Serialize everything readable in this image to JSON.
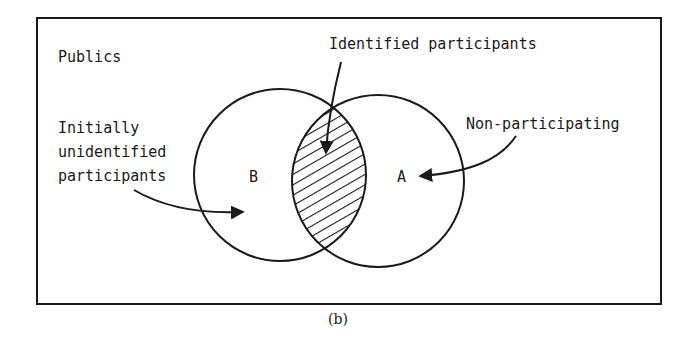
{
  "diagram": {
    "type": "venn",
    "frame_title": "Publics",
    "caption": "(b)",
    "sets": [
      {
        "id": "B",
        "label": "B"
      },
      {
        "id": "A",
        "label": "A"
      }
    ],
    "annotations": {
      "intersection": "Identified participants",
      "set_a": "Non-participating",
      "set_b_line1": "Initially",
      "set_b_line2": "unidentified",
      "set_b_line3": "participants"
    },
    "colors": {
      "ink": "#1a1a1a",
      "background": "#ffffff"
    }
  }
}
